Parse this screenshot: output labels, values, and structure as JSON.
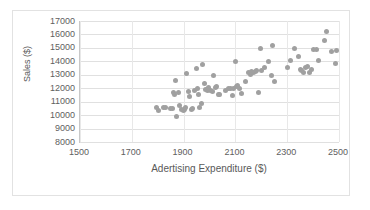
{
  "chart_data": {
    "type": "scatter",
    "title": "",
    "xlabel": "Adertising Expenditure ($)",
    "ylabel": "Sales ($)",
    "xlim": [
      1500,
      2500
    ],
    "ylim": [
      8000,
      17000
    ],
    "xticks": [
      1500,
      1700,
      1900,
      2100,
      2300,
      2500
    ],
    "yticks": [
      8000,
      9000,
      10000,
      11000,
      12000,
      13000,
      14000,
      15000,
      16000,
      17000
    ],
    "grid": "horizontal-and-vertical",
    "legend": "none",
    "marker_color": "#a0a0a0",
    "series": [
      {
        "name": "Sales vs Advertising",
        "points": [
          [
            1795,
            10550
          ],
          [
            1805,
            10350
          ],
          [
            1822,
            10600
          ],
          [
            1832,
            10580
          ],
          [
            1848,
            10520
          ],
          [
            1856,
            10480
          ],
          [
            1862,
            11650
          ],
          [
            1866,
            11520
          ],
          [
            1870,
            12550
          ],
          [
            1874,
            9920
          ],
          [
            1880,
            11700
          ],
          [
            1884,
            10740
          ],
          [
            1892,
            10440
          ],
          [
            1898,
            10330
          ],
          [
            1902,
            10400
          ],
          [
            1908,
            10560
          ],
          [
            1912,
            13100
          ],
          [
            1918,
            11720
          ],
          [
            1924,
            11420
          ],
          [
            1930,
            10430
          ],
          [
            1936,
            10470
          ],
          [
            1942,
            11830
          ],
          [
            1948,
            13460
          ],
          [
            1952,
            12010
          ],
          [
            1958,
            11530
          ],
          [
            1962,
            10560
          ],
          [
            1968,
            10860
          ],
          [
            1974,
            13800
          ],
          [
            1980,
            12360
          ],
          [
            1986,
            11900
          ],
          [
            1992,
            11830
          ],
          [
            1998,
            12020
          ],
          [
            2004,
            11800
          ],
          [
            2010,
            11720
          ],
          [
            2016,
            12960
          ],
          [
            2022,
            12070
          ],
          [
            2028,
            12130
          ],
          [
            2034,
            11560
          ],
          [
            2040,
            11520
          ],
          [
            2062,
            11860
          ],
          [
            2074,
            11950
          ],
          [
            2082,
            12010
          ],
          [
            2088,
            11430
          ],
          [
            2094,
            11990
          ],
          [
            2100,
            14020
          ],
          [
            2104,
            12130
          ],
          [
            2110,
            12200
          ],
          [
            2116,
            11980
          ],
          [
            2122,
            11580
          ],
          [
            2140,
            12520
          ],
          [
            2152,
            13180
          ],
          [
            2158,
            13050
          ],
          [
            2164,
            13220
          ],
          [
            2170,
            13140
          ],
          [
            2176,
            13260
          ],
          [
            2182,
            13290
          ],
          [
            2188,
            11680
          ],
          [
            2196,
            14990
          ],
          [
            2202,
            13340
          ],
          [
            2214,
            13520
          ],
          [
            2226,
            13980
          ],
          [
            2238,
            12980
          ],
          [
            2244,
            15150
          ],
          [
            2250,
            12470
          ],
          [
            2300,
            13550
          ],
          [
            2312,
            14050
          ],
          [
            2330,
            14980
          ],
          [
            2342,
            14330
          ],
          [
            2350,
            13380
          ],
          [
            2356,
            13300
          ],
          [
            2362,
            13180
          ],
          [
            2372,
            13540
          ],
          [
            2380,
            13600
          ],
          [
            2386,
            13180
          ],
          [
            2392,
            13370
          ],
          [
            2400,
            14860
          ],
          [
            2412,
            14900
          ],
          [
            2420,
            14080
          ],
          [
            2444,
            15540
          ],
          [
            2452,
            16220
          ],
          [
            2472,
            14760
          ],
          [
            2486,
            13870
          ],
          [
            2492,
            14780
          ]
        ]
      }
    ]
  }
}
